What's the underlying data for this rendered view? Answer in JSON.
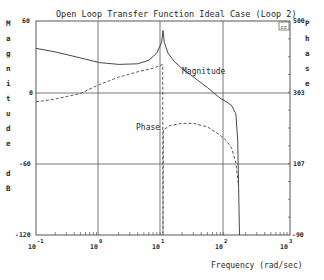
{
  "chart_data": {
    "type": "line",
    "title": "Open Loop Transfer Function Ideal Case (Loop 2)",
    "xlabel": "Frequency (rad/sec)",
    "ylabel_left": "Magnitude dB",
    "ylabel_right": "Phase",
    "x_scale": "log",
    "xlim": [
      0.1,
      1000
    ],
    "ylim_left": [
      -120,
      60
    ],
    "ylim_right": [
      -90,
      500
    ],
    "x_ticks": [
      {
        "base": "10",
        "exp": "-1"
      },
      {
        "base": "10",
        "exp": "0"
      },
      {
        "base": "10",
        "exp": "1"
      },
      {
        "base": "10",
        "exp": "2"
      },
      {
        "base": "10",
        "exp": "3"
      }
    ],
    "y_ticks_left": [
      "60",
      "0",
      "-60",
      "-120"
    ],
    "y_ticks_right": [
      "500",
      "303",
      "107",
      "-90"
    ],
    "grid": true,
    "corner_badge": "cc",
    "annotations": [
      "Magnitude",
      "Phase"
    ],
    "series": [
      {
        "name": "Magnitude",
        "axis": "left",
        "units": "dB",
        "style": "solid",
        "x": [
          0.1,
          0.2,
          0.5,
          1,
          2,
          4,
          6,
          8,
          9.5,
          10,
          10.5,
          12,
          15,
          20,
          30,
          50,
          80,
          100,
          120,
          140,
          150,
          155,
          160
        ],
        "y": [
          37,
          34,
          29,
          25,
          23.5,
          24,
          27,
          33,
          42,
          52,
          42,
          33,
          26,
          20,
          13,
          4,
          -5,
          -8,
          -11,
          -18,
          -40,
          -80,
          -120
        ]
      },
      {
        "name": "Phase",
        "axis": "right",
        "units": "deg",
        "style": "dashed",
        "x": [
          0.1,
          0.2,
          0.5,
          1,
          2,
          4,
          7,
          9.9,
          10,
          10.1,
          13,
          20,
          30,
          50,
          80,
          100,
          120,
          140,
          155
        ],
        "y": [
          277,
          285,
          300,
          325,
          345,
          360,
          370,
          380,
          -90,
          200,
          212,
          218,
          218,
          208,
          185,
          170,
          150,
          110,
          45
        ]
      }
    ]
  },
  "plot": {
    "title": "Open Loop Transfer Function Ideal Case (Loop 2)",
    "xlabel": "Frequency (rad/sec)",
    "ylabel_left_chars": [
      "M",
      "a",
      "g",
      "n",
      "i",
      "t",
      "u",
      "d",
      "e",
      "",
      "d",
      "B"
    ],
    "ylabel_right_chars": [
      "P",
      "h",
      "a",
      "s",
      "e"
    ],
    "badge": "cc",
    "label_magnitude": "Magnitude",
    "label_phase": "Phase",
    "left_ticks": [
      "60",
      "0",
      "-60",
      "-120"
    ],
    "right_ticks": [
      "500",
      "303",
      "107",
      "-90"
    ],
    "x_base": "10",
    "x_exps": [
      "-1",
      "0",
      "1",
      "2",
      "3"
    ]
  }
}
